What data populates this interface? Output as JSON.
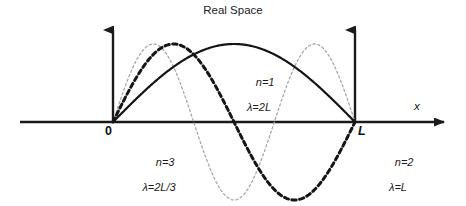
{
  "figure": {
    "title": "Real Space",
    "width": 466,
    "height": 206,
    "background": "#ffffff"
  },
  "axes": {
    "x_axis_label": "x",
    "origin_label": "0",
    "length_label": "L",
    "axis_color": "#1a1a1a"
  },
  "annotations": {
    "n1": {
      "mode": "n=1",
      "wavelength": "λ=2L"
    },
    "n2": {
      "mode": "n=2",
      "wavelength": "λ=L"
    },
    "n3": {
      "mode": "n=3",
      "wavelength": "λ=2L/3"
    }
  },
  "chart_data": {
    "type": "line",
    "title": "Real Space",
    "xlabel": "x",
    "ylabel": "",
    "xlim": [
      0,
      1
    ],
    "ylim": [
      -1.05,
      1.05
    ],
    "grid": false,
    "legend": "annotations-inline",
    "x_tick_labels": [
      "0",
      "L"
    ],
    "x_tick_positions": [
      0,
      1
    ],
    "series": [
      {
        "name": "n=1",
        "mode_number": 1,
        "wavelength": "2L",
        "formula": "sin(pi*x/L)",
        "style": "solid",
        "color": "#151515",
        "line_width": 2.2,
        "nodes": [
          0,
          1
        ],
        "antinodes": [
          0.5
        ],
        "x": [
          0,
          0.05,
          0.1,
          0.15,
          0.2,
          0.25,
          0.3,
          0.35,
          0.4,
          0.45,
          0.5,
          0.55,
          0.6,
          0.65,
          0.7,
          0.75,
          0.8,
          0.85,
          0.9,
          0.95,
          1
        ],
        "values": [
          0,
          0.156,
          0.309,
          0.454,
          0.588,
          0.707,
          0.809,
          0.891,
          0.951,
          0.988,
          1,
          0.988,
          0.951,
          0.891,
          0.809,
          0.707,
          0.588,
          0.454,
          0.309,
          0.156,
          0
        ]
      },
      {
        "name": "n=2",
        "mode_number": 2,
        "wavelength": "L",
        "formula": "sin(2*pi*x/L)",
        "style": "bold-dashed",
        "color": "#151515",
        "line_width": 3.0,
        "nodes": [
          0,
          0.5,
          1
        ],
        "antinodes": [
          0.25,
          0.75
        ],
        "x": [
          0,
          0.05,
          0.1,
          0.15,
          0.2,
          0.25,
          0.3,
          0.35,
          0.4,
          0.45,
          0.5,
          0.55,
          0.6,
          0.65,
          0.7,
          0.75,
          0.8,
          0.85,
          0.9,
          0.95,
          1
        ],
        "values": [
          0,
          0.309,
          0.588,
          0.809,
          0.951,
          1,
          0.951,
          0.809,
          0.588,
          0.309,
          0,
          -0.309,
          -0.588,
          -0.809,
          -0.951,
          -1,
          -0.951,
          -0.809,
          -0.588,
          -0.309,
          0
        ]
      },
      {
        "name": "n=3",
        "mode_number": 3,
        "wavelength": "2L/3",
        "formula": "sin(3*pi*x/L)",
        "style": "light-dotted",
        "color": "#a8a8a8",
        "line_width": 1.3,
        "nodes": [
          0,
          0.3333,
          0.6667,
          1
        ],
        "antinodes": [
          0.1667,
          0.5,
          0.8333
        ],
        "x": [
          0,
          0.05,
          0.1,
          0.15,
          0.2,
          0.25,
          0.3,
          0.35,
          0.4,
          0.45,
          0.5,
          0.55,
          0.6,
          0.65,
          0.7,
          0.75,
          0.8,
          0.85,
          0.9,
          0.95,
          1
        ],
        "values": [
          0,
          0.454,
          0.809,
          0.988,
          0.951,
          0.707,
          0.309,
          -0.156,
          -0.588,
          -0.891,
          -1,
          -0.891,
          -0.588,
          -0.156,
          0.309,
          0.707,
          0.951,
          0.988,
          0.809,
          0.454,
          0
        ]
      }
    ]
  }
}
